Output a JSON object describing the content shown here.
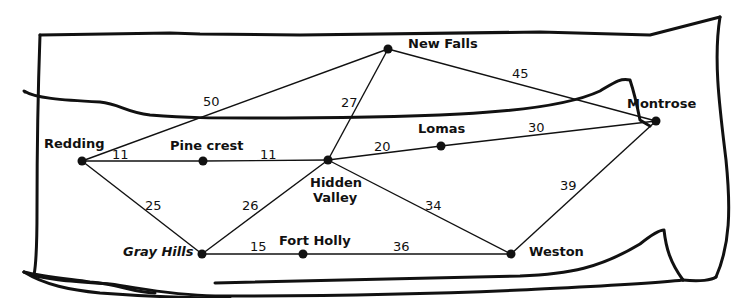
{
  "diagram": {
    "type": "weighted-graph-map",
    "colors": {
      "ink": "#111111",
      "paper": "#ffffff"
    },
    "nodes": [
      {
        "id": "redding",
        "label": "Redding",
        "x": 82,
        "y": 161,
        "lx": 44,
        "ly": 148,
        "anchor": "start",
        "italic": false
      },
      {
        "id": "pinecrest",
        "label": "Pine crest",
        "x": 203,
        "y": 161,
        "lx": 170,
        "ly": 150,
        "anchor": "start",
        "italic": false
      },
      {
        "id": "hiddenvalley",
        "label": "Hidden",
        "label2": "Valley",
        "x": 328,
        "y": 160,
        "lx": 310,
        "ly": 187,
        "anchor": "start",
        "italic": false
      },
      {
        "id": "newfalls",
        "label": "New Falls",
        "x": 388,
        "y": 49,
        "lx": 408,
        "ly": 48,
        "anchor": "start",
        "italic": false
      },
      {
        "id": "lomas",
        "label": "Lomas",
        "x": 441,
        "y": 146,
        "lx": 418,
        "ly": 133,
        "anchor": "start",
        "italic": false
      },
      {
        "id": "montrose",
        "label": "Montrose",
        "x": 656,
        "y": 121,
        "lx": 627,
        "ly": 108,
        "anchor": "start",
        "italic": false
      },
      {
        "id": "grayhills",
        "label": "Gray Hills",
        "x": 202,
        "y": 254,
        "lx": 123,
        "ly": 256,
        "anchor": "start",
        "italic": true
      },
      {
        "id": "fortholly",
        "label": "Fort Holly",
        "x": 303,
        "y": 254,
        "lx": 279,
        "ly": 245,
        "anchor": "start",
        "italic": false
      },
      {
        "id": "weston",
        "label": "Weston",
        "x": 511,
        "y": 254,
        "lx": 529,
        "ly": 256,
        "anchor": "start",
        "italic": false
      }
    ],
    "edges": [
      {
        "from": "redding",
        "to": "newfalls",
        "weight": "50",
        "wx": 203,
        "wy": 106
      },
      {
        "from": "redding",
        "to": "pinecrest",
        "weight": "11",
        "wx": 112,
        "wy": 159
      },
      {
        "from": "pinecrest",
        "to": "hiddenvalley",
        "weight": "11",
        "wx": 260,
        "wy": 159
      },
      {
        "from": "redding",
        "to": "grayhills",
        "weight": "25",
        "wx": 145,
        "wy": 210
      },
      {
        "from": "hiddenvalley",
        "to": "newfalls",
        "weight": "27",
        "wx": 341,
        "wy": 107
      },
      {
        "from": "hiddenvalley",
        "to": "lomas",
        "weight": "20",
        "wx": 374,
        "wy": 151
      },
      {
        "from": "lomas",
        "to": "montrose",
        "weight": "30",
        "wx": 528,
        "wy": 132
      },
      {
        "from": "newfalls",
        "to": "montrose",
        "weight": "45",
        "wx": 512,
        "wy": 78
      },
      {
        "from": "hiddenvalley",
        "to": "grayhills",
        "weight": "26",
        "wx": 242,
        "wy": 210
      },
      {
        "from": "hiddenvalley",
        "to": "weston",
        "weight": "34",
        "wx": 425,
        "wy": 210
      },
      {
        "from": "montrose",
        "to": "weston",
        "weight": "39",
        "wx": 560,
        "wy": 190
      },
      {
        "from": "grayhills",
        "to": "fortholly",
        "weight": "15",
        "wx": 250,
        "wy": 251
      },
      {
        "from": "fortholly",
        "to": "weston",
        "weight": "36",
        "wx": 393,
        "wy": 251
      }
    ]
  }
}
